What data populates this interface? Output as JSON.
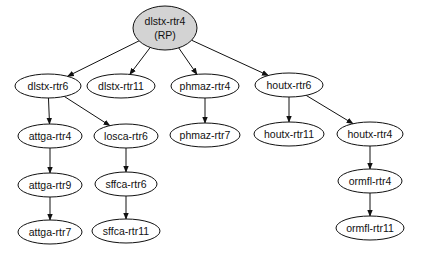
{
  "diagram": {
    "type": "directed-tree",
    "colors": {
      "root_fill": "#d3d3d3",
      "node_fill": "#ffffff",
      "stroke": "#111111"
    },
    "nodes": [
      {
        "id": "root",
        "label": "dlstx-rtr4",
        "sublabel": "(RP)",
        "x": 165,
        "y": 28,
        "rx": 32,
        "ry": 22,
        "root": true
      },
      {
        "id": "dlstx-rtr6",
        "label": "dlstx-rtr6",
        "x": 48,
        "y": 86,
        "rx": 33,
        "ry": 12
      },
      {
        "id": "dlstx-rtr11",
        "label": "dlstx-rtr11",
        "x": 121,
        "y": 86,
        "rx": 34,
        "ry": 12
      },
      {
        "id": "phmaz-rtr4",
        "label": "phmaz-rtr4",
        "x": 205,
        "y": 86,
        "rx": 34,
        "ry": 12
      },
      {
        "id": "houtx-rtr6",
        "label": "houtx-rtr6",
        "x": 289,
        "y": 85,
        "rx": 34,
        "ry": 12
      },
      {
        "id": "attga-rtr4",
        "label": "attga-rtr4",
        "x": 50,
        "y": 136,
        "rx": 32,
        "ry": 12
      },
      {
        "id": "losca-rtr6",
        "label": "losca-rtr6",
        "x": 126,
        "y": 136,
        "rx": 32,
        "ry": 12
      },
      {
        "id": "phmaz-rtr7",
        "label": "phmaz-rtr7",
        "x": 205,
        "y": 135,
        "rx": 35,
        "ry": 12
      },
      {
        "id": "houtx-rtr11",
        "label": "houtx-rtr11",
        "x": 289,
        "y": 134,
        "rx": 35,
        "ry": 12
      },
      {
        "id": "houtx-rtr4",
        "label": "houtx-rtr4",
        "x": 370,
        "y": 134,
        "rx": 33,
        "ry": 12
      },
      {
        "id": "attga-rtr9",
        "label": "attga-rtr9",
        "x": 50,
        "y": 185,
        "rx": 32,
        "ry": 12
      },
      {
        "id": "sffca-rtr6",
        "label": "sffca-rtr6",
        "x": 126,
        "y": 184,
        "rx": 31,
        "ry": 12
      },
      {
        "id": "ormfl-rtr4",
        "label": "ormfl-rtr4",
        "x": 370,
        "y": 181,
        "rx": 32,
        "ry": 12
      },
      {
        "id": "attga-rtr7",
        "label": "attga-rtr7",
        "x": 50,
        "y": 232,
        "rx": 32,
        "ry": 12
      },
      {
        "id": "sffca-rtr11",
        "label": "sffca-rtr11",
        "x": 126,
        "y": 231,
        "rx": 34,
        "ry": 12
      },
      {
        "id": "ormfl-rtr11",
        "label": "ormfl-rtr11",
        "x": 370,
        "y": 228,
        "rx": 34,
        "ry": 12
      }
    ],
    "edges": [
      [
        "root",
        "dlstx-rtr6"
      ],
      [
        "root",
        "dlstx-rtr11"
      ],
      [
        "root",
        "phmaz-rtr4"
      ],
      [
        "root",
        "houtx-rtr6"
      ],
      [
        "dlstx-rtr6",
        "attga-rtr4"
      ],
      [
        "dlstx-rtr6",
        "losca-rtr6"
      ],
      [
        "phmaz-rtr4",
        "phmaz-rtr7"
      ],
      [
        "houtx-rtr6",
        "houtx-rtr11"
      ],
      [
        "houtx-rtr6",
        "houtx-rtr4"
      ],
      [
        "attga-rtr4",
        "attga-rtr9"
      ],
      [
        "attga-rtr9",
        "attga-rtr7"
      ],
      [
        "losca-rtr6",
        "sffca-rtr6"
      ],
      [
        "sffca-rtr6",
        "sffca-rtr11"
      ],
      [
        "houtx-rtr4",
        "ormfl-rtr4"
      ],
      [
        "ormfl-rtr4",
        "ormfl-rtr11"
      ]
    ]
  }
}
